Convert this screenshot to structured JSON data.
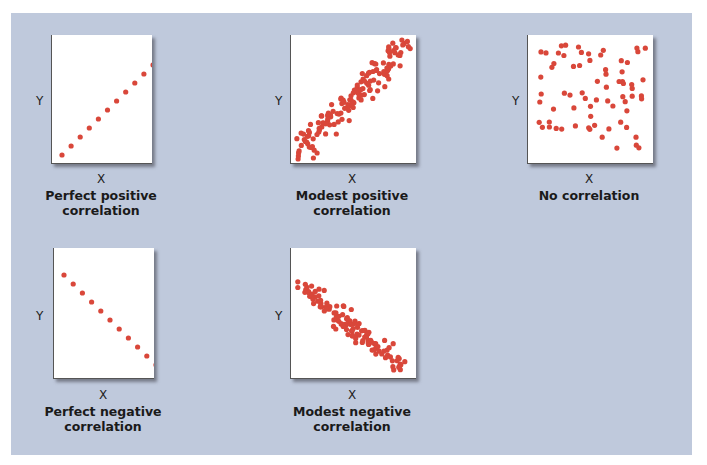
{
  "chart_data": [
    {
      "type": "scatter",
      "title": "Perfect positive correlation",
      "xlabel": "X",
      "ylabel": "Y",
      "grid": false,
      "point_color": "#d9473a",
      "x": [
        1,
        2,
        3,
        4,
        5,
        6,
        7,
        8,
        9,
        10,
        11
      ],
      "y": [
        1,
        2,
        3,
        4,
        5,
        6,
        7,
        8,
        9,
        10,
        11
      ]
    },
    {
      "type": "scatter",
      "title": "Modest positive correlation",
      "xlabel": "X",
      "ylabel": "Y",
      "grid": false,
      "point_color": "#d9473a",
      "description": "approx. 150 points clustered around a positive-slope diagonal band"
    },
    {
      "type": "scatter",
      "title": "No correlation",
      "xlabel": "X",
      "ylabel": "Y",
      "grid": false,
      "point_color": "#d9473a",
      "description": "approx. 70 points scattered uniformly"
    },
    {
      "type": "scatter",
      "title": "Perfect negative correlation",
      "xlabel": "X",
      "ylabel": "Y",
      "grid": false,
      "point_color": "#d9473a",
      "x": [
        1,
        2,
        3,
        4,
        5,
        6,
        7,
        8,
        9,
        10,
        11
      ],
      "y": [
        11,
        10,
        9,
        8,
        7,
        6,
        5,
        4,
        3,
        2,
        1
      ]
    },
    {
      "type": "scatter",
      "title": "Modest negative correlation",
      "xlabel": "X",
      "ylabel": "Y",
      "grid": false,
      "point_color": "#d9473a",
      "description": "approx. 120 points clustered around a negative-slope diagonal band"
    }
  ],
  "panels": [
    {
      "caption_line1": "Perfect positive",
      "caption_line2": "correlation",
      "xlabel": "X",
      "ylabel": "Y"
    },
    {
      "caption_line1": "Modest positive",
      "caption_line2": "correlation",
      "xlabel": "X",
      "ylabel": "Y"
    },
    {
      "caption_line1": "No correlation",
      "caption_line2": "",
      "xlabel": "X",
      "ylabel": "Y"
    },
    {
      "caption_line1": "Perfect negative",
      "caption_line2": "correlation",
      "xlabel": "X",
      "ylabel": "Y"
    },
    {
      "caption_line1": "Modest negative",
      "caption_line2": "correlation",
      "xlabel": "X",
      "ylabel": "Y"
    }
  ],
  "colors": {
    "background": "#bfc9dc",
    "plot_bg": "#ffffff",
    "points": "#d9473a"
  }
}
